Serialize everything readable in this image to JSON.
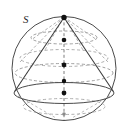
{
  "figure": {
    "labels": [
      {
        "name": "sphere-label-s",
        "text": "S",
        "x": 23,
        "y": 23
      }
    ],
    "colors": {
      "stroke_solid": "#4a4a4a",
      "stroke_dashed": "#8f8f8f",
      "stroke_cone": "#3a3a3a",
      "point_fill": "#111111",
      "background": "#ffffff"
    },
    "sphere": {
      "name": "sphere-outline",
      "cx": 64,
      "cy": 68.5,
      "r": 52,
      "stroke_width": 1.0
    },
    "cone": {
      "apex": {
        "x": 64,
        "y": 17
      },
      "base_ellipse": {
        "cx": 64,
        "cy": 93,
        "rx": 50,
        "ry": 10.5
      },
      "slant_left": {
        "x1": 64,
        "y1": 17,
        "x2": 14.5,
        "y2": 92
      },
      "slant_right": {
        "x1": 64,
        "y1": 17,
        "x2": 113.5,
        "y2": 92
      }
    },
    "latitude_circles": [
      {
        "name": "latitude-ellipse-1",
        "cx": 64,
        "cy": 37.5,
        "rx": 33,
        "ry": 6.5,
        "dashed": true
      },
      {
        "name": "latitude-ellipse-2",
        "cx": 64,
        "cy": 58.0,
        "rx": 44,
        "ry": 8.5,
        "dashed": true
      },
      {
        "name": "latitude-ellipse-3",
        "cx": 64,
        "cy": 73.0,
        "rx": 49,
        "ry": 9.5,
        "dashed": true
      },
      {
        "name": "latitude-ellipse-4",
        "cx": 64,
        "cy": 93.0,
        "rx": 50,
        "ry": 10.5,
        "dashed": false
      },
      {
        "name": "latitude-ellipse-5",
        "cx": 64,
        "cy": 106.5,
        "rx": 41,
        "ry": 8.0,
        "dashed": true
      }
    ],
    "axis": {
      "name": "vertical-axis",
      "x": 64,
      "y_top": 17,
      "y_bottom": 120,
      "dashed": true
    },
    "axis_points": [
      {
        "name": "apex-point",
        "x": 64,
        "y": 17,
        "r": 2.6
      },
      {
        "name": "axis-point-1",
        "x": 64,
        "y": 40,
        "r": 2.3
      },
      {
        "name": "axis-point-2",
        "x": 64,
        "y": 65,
        "r": 2.4
      },
      {
        "name": "axis-point-3",
        "x": 64,
        "y": 81,
        "r": 2.2
      },
      {
        "name": "axis-point-4",
        "x": 64,
        "y": 93,
        "r": 2.4
      },
      {
        "name": "axis-point-5",
        "x": 64,
        "y": 114,
        "r": 1.9
      }
    ],
    "dashed_generators": [
      {
        "name": "generator-dashed-1",
        "x1": 64,
        "y1": 17,
        "x2": 31,
        "y2": 40
      },
      {
        "name": "generator-dashed-2",
        "x1": 64,
        "y1": 17,
        "x2": 97,
        "y2": 40
      },
      {
        "name": "generator-dashed-3",
        "x1": 64,
        "y1": 17,
        "x2": 20,
        "y2": 60
      },
      {
        "name": "generator-dashed-4",
        "x1": 64,
        "y1": 17,
        "x2": 108,
        "y2": 60
      },
      {
        "name": "generator-dashed-5",
        "x1": 64,
        "y1": 17,
        "x2": 44,
        "y2": 47
      },
      {
        "name": "generator-dashed-6",
        "x1": 64,
        "y1": 17,
        "x2": 84,
        "y2": 47
      }
    ],
    "lower_dashed_generators": [
      {
        "name": "lower-generator-1",
        "x1": 17,
        "y1": 95,
        "x2": 55,
        "y2": 118
      },
      {
        "name": "lower-generator-2",
        "x1": 111,
        "y1": 95,
        "x2": 73,
        "y2": 118
      }
    ]
  }
}
